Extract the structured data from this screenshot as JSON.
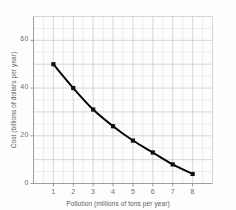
{
  "chart_data": {
    "type": "line",
    "title": "",
    "xlabel": "Pollution (millions of tons per year)",
    "ylabel": "Cost (billions of dollars per year)",
    "x": [
      1,
      2,
      3,
      4,
      5,
      6,
      7,
      8
    ],
    "values": [
      50,
      40,
      31,
      24,
      18,
      13,
      8,
      4
    ],
    "series": [
      {
        "name": "Cost vs Pollution",
        "values": [
          50,
          40,
          31,
          24,
          18,
          13,
          8,
          4
        ]
      }
    ],
    "xlim": [
      0,
      9
    ],
    "ylim": [
      0,
      70
    ],
    "xticks": [
      "1",
      "2",
      "3",
      "4",
      "5",
      "6",
      "7",
      "8"
    ],
    "xtick_values": [
      1,
      2,
      3,
      4,
      5,
      6,
      7,
      8
    ],
    "yticks": [
      "0",
      "20",
      "40",
      "60"
    ],
    "ytick_values": [
      0,
      20,
      40,
      60
    ],
    "grid": true,
    "grid_minor": true,
    "legend": false,
    "legend_position": "none",
    "marker": "filled-square",
    "line_color": "#000000",
    "marker_color": "#111111",
    "grid_color": "#c9cdd4",
    "axis_color": "#9aa0a6",
    "background": "#fdfdfd"
  }
}
